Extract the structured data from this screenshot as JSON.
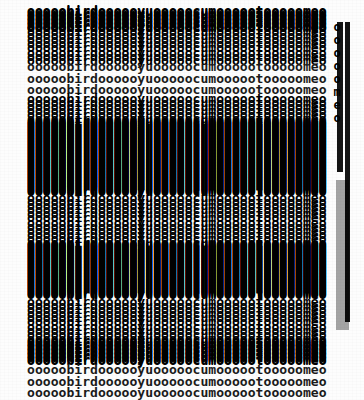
{
  "document": {
    "kind": "scanned-ascii-text",
    "line_text": "ooooobirdoooooyuooooocumoooootooooomeo",
    "words_embedded": [
      "bird",
      "yu",
      "cum",
      "t",
      "meo"
    ],
    "fill_character": "o",
    "columns": 38,
    "ink_color": "#111111",
    "paper_color": "#fdfdfd",
    "top_legible_lines": [
      "ooooobirdoooooyuooooocumoooootooooomeo",
      "ooooobirdoooooyuooooocumoooootooooomeo",
      "ooooobirdoooooyuooooocumoooootooooomeo"
    ],
    "bottom_legible_lines": [
      "ooooobirdoooooyuooooocumoooootooooomeo",
      "ooooobirdoooooyuooooocumoooootooooomeo",
      "ooooobirdoooooyuooooocumoooootooooomeo"
    ],
    "edge_marginalia": "ooooomeo"
  }
}
